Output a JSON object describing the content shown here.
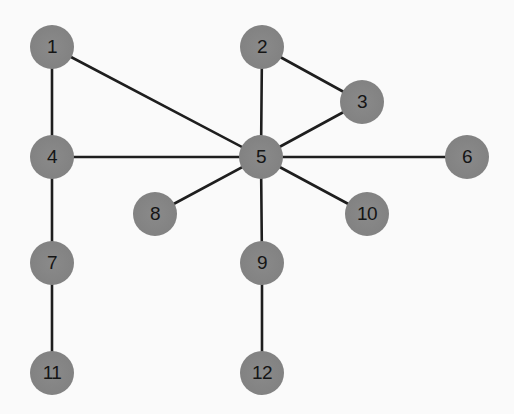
{
  "graph": {
    "node_color": "#848484",
    "edge_color": "#1e1e1e",
    "background": "#fafafa",
    "nodes": [
      {
        "id": "1",
        "label": "1",
        "x": 52,
        "y": 47
      },
      {
        "id": "2",
        "label": "2",
        "x": 262,
        "y": 47
      },
      {
        "id": "3",
        "label": "3",
        "x": 362,
        "y": 102
      },
      {
        "id": "4",
        "label": "4",
        "x": 52,
        "y": 157
      },
      {
        "id": "5",
        "label": "5",
        "x": 261,
        "y": 157
      },
      {
        "id": "6",
        "label": "6",
        "x": 467,
        "y": 157
      },
      {
        "id": "7",
        "label": "7",
        "x": 52,
        "y": 263
      },
      {
        "id": "8",
        "label": "8",
        "x": 155,
        "y": 214
      },
      {
        "id": "9",
        "label": "9",
        "x": 262,
        "y": 263
      },
      {
        "id": "10",
        "label": "10",
        "x": 367,
        "y": 214
      },
      {
        "id": "11",
        "label": "11",
        "x": 52,
        "y": 373
      },
      {
        "id": "12",
        "label": "12",
        "x": 262,
        "y": 373
      }
    ],
    "edges": [
      [
        "1",
        "4"
      ],
      [
        "1",
        "5"
      ],
      [
        "2",
        "3"
      ],
      [
        "2",
        "5"
      ],
      [
        "3",
        "5"
      ],
      [
        "4",
        "5"
      ],
      [
        "5",
        "6"
      ],
      [
        "5",
        "8"
      ],
      [
        "5",
        "10"
      ],
      [
        "5",
        "9"
      ],
      [
        "4",
        "7"
      ],
      [
        "7",
        "11"
      ],
      [
        "9",
        "12"
      ]
    ]
  }
}
